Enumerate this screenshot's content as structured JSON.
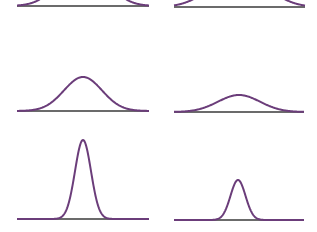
{
  "figure": {
    "curve_color": "#6b3d7a",
    "baseline_color": "#3a3a3a",
    "background": "#ffffff",
    "panels": [
      {
        "id": "row1-left",
        "baseline": {
          "x1": 17,
          "x2": 149,
          "y": 6
        },
        "curve": {
          "center": 83,
          "peak_y": -40,
          "sigma": 22
        }
      },
      {
        "id": "row1-right",
        "baseline": {
          "x1": 174,
          "x2": 305,
          "y": 7
        },
        "curve": {
          "center": 239,
          "peak_y": -30,
          "sigma": 26
        }
      },
      {
        "id": "row2-left",
        "baseline": {
          "x1": 17,
          "x2": 149,
          "y": 111
        },
        "curve": {
          "center": 83,
          "peak_y": 77,
          "sigma": 19
        }
      },
      {
        "id": "row2-right",
        "baseline": {
          "x1": 174,
          "x2": 304,
          "y": 112
        },
        "curve": {
          "center": 239,
          "peak_y": 95,
          "sigma": 21
        }
      },
      {
        "id": "row3-left",
        "baseline": {
          "x1": 17,
          "x2": 149,
          "y": 219
        },
        "curve": {
          "center": 83,
          "peak_y": 140,
          "sigma": 8
        }
      },
      {
        "id": "row3-right",
        "baseline": {
          "x1": 174,
          "x2": 304,
          "y": 220
        },
        "curve": {
          "center": 238,
          "peak_y": 180,
          "sigma": 7.5
        }
      }
    ]
  },
  "caption": {
    "text": "",
    "note": "cropped"
  }
}
